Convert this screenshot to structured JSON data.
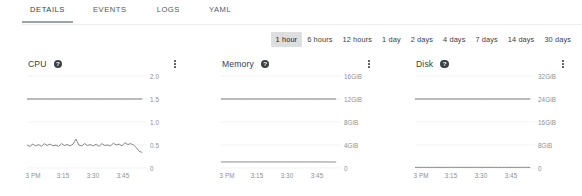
{
  "tabs": [
    {
      "label": "DETAILS",
      "active": true
    },
    {
      "label": "EVENTS",
      "active": false
    },
    {
      "label": "LOGS",
      "active": false
    },
    {
      "label": "YAML",
      "active": false
    }
  ],
  "time_range": {
    "selected": "1 hour",
    "options": [
      "1 hour",
      "6 hours",
      "12 hours",
      "1 day",
      "2 days",
      "4 days",
      "7 days",
      "14 days",
      "30 days"
    ]
  },
  "colors": {
    "gridline": "#ededed",
    "series_limit": "#5f6368",
    "series_usage": "#70757a",
    "tab_underline": "#9aa4ad",
    "selected_bg": "#dddee0",
    "axis_text": "#8a9099",
    "title_text": "#3c4043"
  },
  "cards": [
    {
      "title": "CPU",
      "help_icon": "help-circle-icon",
      "menu_icon": "kebab-menu-icon",
      "chart_data": {
        "type": "line",
        "title": "CPU",
        "xlabel": "",
        "ylabel": "",
        "grid": true,
        "legend": "none",
        "ylim": [
          0,
          2.0
        ],
        "ytick_labels": [
          "2.0",
          "1.5",
          "1.0",
          "0.5",
          "0"
        ],
        "yticks": [
          2.0,
          1.5,
          1.0,
          0.5,
          0
        ],
        "xtick_labels": [
          "3 PM",
          "3:15",
          "3:30",
          "3:45"
        ],
        "xticks": [
          0,
          25,
          50,
          75
        ],
        "xlim": [
          0,
          100
        ],
        "series": [
          {
            "name": "limit",
            "values": [
              1.5,
              1.5,
              1.5,
              1.5,
              1.5,
              1.5,
              1.5,
              1.5,
              1.5,
              1.5,
              1.5,
              1.5,
              1.5,
              1.5,
              1.5,
              1.5,
              1.5,
              1.5,
              1.5,
              1.5,
              1.5,
              1.5,
              1.5,
              1.5,
              1.5,
              1.5,
              1.5,
              1.5,
              1.5,
              1.5,
              1.5,
              1.5,
              1.5,
              1.5,
              1.5,
              1.5,
              1.5,
              1.5,
              1.5,
              1.5,
              1.5
            ]
          },
          {
            "name": "usage",
            "values": [
              0.5,
              0.47,
              0.52,
              0.48,
              0.51,
              0.47,
              0.53,
              0.49,
              0.52,
              0.48,
              0.5,
              0.47,
              0.53,
              0.49,
              0.51,
              0.48,
              0.52,
              0.63,
              0.5,
              0.48,
              0.53,
              0.49,
              0.51,
              0.48,
              0.52,
              0.47,
              0.53,
              0.49,
              0.5,
              0.48,
              0.54,
              0.5,
              0.52,
              0.48,
              0.55,
              0.51,
              0.53,
              0.5,
              0.44,
              0.36,
              0.34
            ]
          }
        ]
      }
    },
    {
      "title": "Memory",
      "help_icon": "help-circle-icon",
      "menu_icon": "kebab-menu-icon",
      "chart_data": {
        "type": "line",
        "title": "Memory",
        "xlabel": "",
        "ylabel": "",
        "grid": true,
        "legend": "none",
        "ylim": [
          0,
          16
        ],
        "ytick_labels": [
          "16GiB",
          "12GiB",
          "8GiB",
          "4GiB",
          "0"
        ],
        "yticks": [
          16,
          12,
          8,
          4,
          0
        ],
        "xtick_labels": [
          "3 PM",
          "3:15",
          "3:30",
          "3:45"
        ],
        "xticks": [
          0,
          25,
          50,
          75
        ],
        "xlim": [
          0,
          100
        ],
        "units": "GiB",
        "series": [
          {
            "name": "limit",
            "values": [
              12,
              12,
              12,
              12,
              12,
              12,
              12,
              12,
              12,
              12,
              12,
              12,
              12,
              12,
              12,
              12,
              12,
              12,
              12,
              12,
              12,
              12,
              12,
              12,
              12,
              12,
              12,
              12,
              12,
              12,
              12,
              12,
              12,
              12,
              12,
              12,
              12,
              12,
              12,
              12,
              12
            ]
          },
          {
            "name": "usage",
            "values": [
              1.05,
              1.05,
              1.06,
              1.05,
              1.05,
              1.06,
              1.05,
              1.05,
              1.06,
              1.05,
              1.05,
              1.05,
              1.06,
              1.05,
              1.05,
              1.06,
              1.05,
              1.05,
              1.06,
              1.05,
              1.05,
              1.06,
              1.05,
              1.05,
              1.06,
              1.05,
              1.05,
              1.05,
              1.06,
              1.05,
              1.05,
              1.06,
              1.05,
              1.05,
              1.06,
              1.05,
              1.05,
              1.05,
              1.04,
              1.04,
              1.04
            ]
          }
        ]
      }
    },
    {
      "title": "Disk",
      "help_icon": "help-circle-icon",
      "menu_icon": "kebab-menu-icon",
      "chart_data": {
        "type": "line",
        "title": "Disk",
        "xlabel": "",
        "ylabel": "",
        "grid": true,
        "legend": "none",
        "ylim": [
          0,
          32
        ],
        "ytick_labels": [
          "32GiB",
          "24GiB",
          "16GiB",
          "8GiB",
          "0"
        ],
        "yticks": [
          32,
          24,
          16,
          8,
          0
        ],
        "xtick_labels": [
          "3 PM",
          "3:15",
          "3:30",
          "3:45"
        ],
        "xticks": [
          0,
          25,
          50,
          75
        ],
        "xlim": [
          0,
          100
        ],
        "units": "GiB",
        "series": [
          {
            "name": "limit",
            "values": [
              24,
              24,
              24,
              24,
              24,
              24,
              24,
              24,
              24,
              24,
              24,
              24,
              24,
              24,
              24,
              24,
              24,
              24,
              24,
              24,
              24,
              24,
              24,
              24,
              24,
              24,
              24,
              24,
              24,
              24,
              24,
              24,
              24,
              24,
              24,
              24,
              24,
              24,
              24,
              24,
              24
            ]
          },
          {
            "name": "usage",
            "values": [
              0.22,
              0.22,
              0.22,
              0.22,
              0.22,
              0.22,
              0.22,
              0.22,
              0.22,
              0.22,
              0.22,
              0.22,
              0.22,
              0.22,
              0.22,
              0.22,
              0.22,
              0.22,
              0.22,
              0.22,
              0.22,
              0.22,
              0.22,
              0.22,
              0.22,
              0.22,
              0.22,
              0.22,
              0.22,
              0.22,
              0.22,
              0.22,
              0.22,
              0.22,
              0.22,
              0.22,
              0.22,
              0.22,
              0.22,
              0.22,
              0.22
            ]
          }
        ]
      }
    }
  ]
}
